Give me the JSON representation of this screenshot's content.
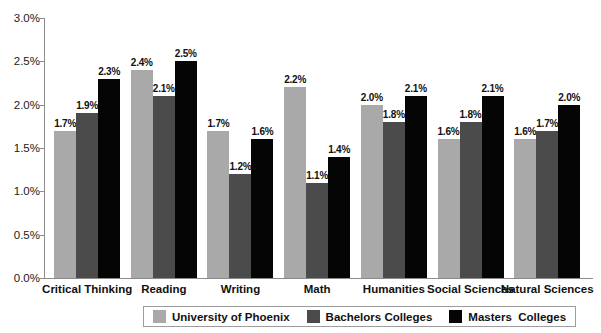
{
  "chart_data": {
    "type": "bar",
    "title": "",
    "xlabel": "",
    "ylabel": "",
    "ylim": [
      0,
      3.0
    ],
    "ytick_labels": [
      "0.0%",
      "0.5%",
      "1.0%",
      "1.5%",
      "2.0%",
      "2.5%",
      "3.0%"
    ],
    "ytick_values": [
      0.0,
      0.5,
      1.0,
      1.5,
      2.0,
      2.5,
      3.0
    ],
    "grid": false,
    "legend_position": "bottom",
    "value_suffix": "%",
    "categories": [
      "Critical Thinking",
      "Reading",
      "Writing",
      "Math",
      "Humanities",
      "Social Sciences",
      "Natural Sciences"
    ],
    "series": [
      {
        "name": "University of Phoenix",
        "color": "#a9a9a9",
        "values": [
          1.7,
          2.4,
          1.7,
          2.2,
          2.0,
          1.6,
          1.6
        ],
        "labels": [
          "1.7%",
          "2.4%",
          "1.7%",
          "2.2%",
          "2.0%",
          "1.6%",
          "1.6%"
        ]
      },
      {
        "name": "Bachelors Colleges",
        "color": "#4b4b4b",
        "values": [
          1.9,
          2.1,
          1.2,
          1.1,
          1.8,
          1.8,
          1.7
        ],
        "labels": [
          "1.9%",
          "2.1%",
          "1.2%",
          "1.1%",
          "1.8%",
          "1.8%",
          "1.7%"
        ]
      },
      {
        "name": "Masters  Colleges",
        "color": "#050505",
        "values": [
          2.3,
          2.5,
          1.6,
          1.4,
          2.1,
          2.1,
          2.0
        ],
        "labels": [
          "2.3%",
          "2.5%",
          "1.6%",
          "1.4%",
          "2.1%",
          "2.1%",
          "2.0%"
        ]
      }
    ]
  }
}
